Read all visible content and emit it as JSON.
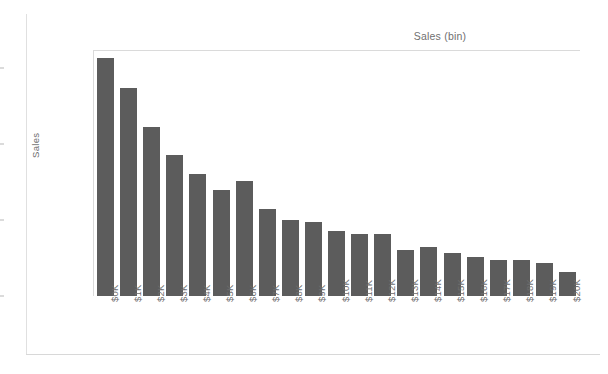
{
  "chart_data": {
    "type": "bar",
    "title": "Sales (bin)",
    "xlabel": "",
    "ylabel": "Sales",
    "categories": [
      "$0K",
      "$1K",
      "$2K",
      "$3K",
      "$4K",
      "$5K",
      "$6K",
      "$7K",
      "$8K",
      "$9K",
      "$10K",
      "$11K",
      "$12K",
      "$13K",
      "$14K",
      "$15K",
      "$16K",
      "$17K",
      "$18K",
      "$19K",
      "$20K"
    ],
    "values": [
      3.13,
      2.74,
      2.22,
      1.86,
      1.61,
      1.39,
      1.51,
      1.15,
      1.0,
      0.97,
      0.85,
      0.82,
      0.82,
      0.6,
      0.65,
      0.56,
      0.51,
      0.48,
      0.48,
      0.43,
      0.32
    ],
    "value_unit": "millions of dollars",
    "ylim": [
      0,
      3.24
    ],
    "y_ticks": [
      "$0.0M",
      "$1.0M",
      "$2.0M",
      "$3.0M"
    ],
    "y_tick_values": [
      0,
      1,
      2,
      3
    ],
    "grid": false,
    "legend": null,
    "bar_color": "#5c5c5c",
    "axis_text_color": "#6e6e6e",
    "axis_line_color": "#dadada",
    "background_color": "#ffffff"
  },
  "axis_titles": {
    "y": "Sales"
  },
  "header": {
    "title": "Sales (bin)"
  }
}
